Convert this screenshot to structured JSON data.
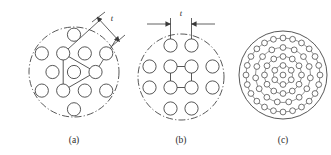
{
  "figure": {
    "background_color": "#ffffff",
    "line_color": "#3a3a3a",
    "panels": [
      {
        "id": "a",
        "caption": "(a)",
        "pattern_name": "triangular-pitch",
        "boundary_style": "chain-dash",
        "dimension_label": "t",
        "dimension_label_style": "italic",
        "dimension_type": "leader-with-arrows",
        "hole_count": 13,
        "overlay_shape": "triangle",
        "center": [
          74,
          72
        ],
        "boundary_radius": 45,
        "hole_radius": 6.6,
        "pitch": 21.5,
        "holes": [
          [
            74.0,
            72.0
          ],
          [
            52.5,
            72.0
          ],
          [
            95.5,
            72.0
          ],
          [
            63.2,
            53.4
          ],
          [
            84.8,
            53.4
          ],
          [
            63.2,
            90.6
          ],
          [
            84.8,
            90.6
          ],
          [
            41.8,
            53.4
          ],
          [
            106.2,
            53.4
          ],
          [
            41.8,
            90.6
          ],
          [
            106.2,
            90.6
          ],
          [
            74.0,
            34.7
          ],
          [
            74.0,
            109.3
          ]
        ],
        "triangle_vertices": [
          [
            63.2,
            53.4
          ],
          [
            95.5,
            72.0
          ],
          [
            63.2,
            90.6
          ]
        ],
        "leader_lines": [
          {
            "from": [
              63.2,
              53.4
            ],
            "to": [
              100.0,
              20.0
            ]
          },
          {
            "from": [
              95.5,
              72.0
            ],
            "to": [
              117.0,
              38.0
            ]
          }
        ],
        "dimension_line": {
          "from": [
            97.0,
            17.0
          ],
          "to": [
            119.5,
            41.5
          ]
        },
        "dimension_extensions": [
          {
            "from": [
              92.0,
              22.0
            ],
            "to": [
              105.0,
              12.0
            ]
          },
          {
            "from": [
              112.0,
              46.0
            ],
            "to": [
              125.0,
              35.0
            ]
          }
        ],
        "label_position": [
          112,
          21
        ]
      },
      {
        "id": "b",
        "caption": "(b)",
        "pattern_name": "square-pitch",
        "boundary_style": "chain-dash",
        "dimension_label": "t",
        "dimension_label_style": "italic",
        "dimension_type": "linear-with-extension-lines",
        "hole_count": 12,
        "overlay_shape": "square-grid",
        "center": [
          181,
          77
        ],
        "boundary_radius": 43,
        "hole_radius": 6.6,
        "pitch": 21.0,
        "holes": [
          [
            170.5,
            45.5
          ],
          [
            191.5,
            45.5
          ],
          [
            170.5,
            66.5
          ],
          [
            191.5,
            66.5
          ],
          [
            170.5,
            87.5
          ],
          [
            191.5,
            87.5
          ],
          [
            149.5,
            66.5
          ],
          [
            212.5,
            66.5
          ],
          [
            149.5,
            87.5
          ],
          [
            212.5,
            87.5
          ],
          [
            170.5,
            108.5
          ],
          [
            191.5,
            108.5
          ]
        ],
        "grid_squares": [
          [
            [
              170.5,
              66.5
            ],
            [
              191.5,
              66.5
            ],
            [
              191.5,
              87.5
            ],
            [
              170.5,
              87.5
            ]
          ]
        ],
        "extension_lines": [
          {
            "from": [
              170.5,
              45.5
            ],
            "to": [
              170.5,
              18.0
            ]
          },
          {
            "from": [
              191.5,
              45.5
            ],
            "to": [
              191.5,
              18.0
            ]
          }
        ],
        "dimension_line": {
          "y": 24.0,
          "from_x": 147.0,
          "to_x": 215.0
        },
        "arrow_inner_from_x": 170.5,
        "arrow_inner_to_x": 191.5,
        "label_position": [
          181,
          16
        ]
      },
      {
        "id": "c",
        "caption": "(c)",
        "pattern_name": "concentric-circular-pitch",
        "boundary_style": "solid",
        "dimension_label": "",
        "hole_count": 49,
        "center": [
          283,
          75
        ],
        "boundary_radius": 44,
        "hole_radius": 2.9,
        "rings": [
          {
            "radius": 0,
            "count": 1
          },
          {
            "radius": 9.5,
            "count": 6
          },
          {
            "radius": 18.5,
            "count": 12
          },
          {
            "radius": 27.5,
            "count": 15
          },
          {
            "radius": 37.0,
            "count": 24
          }
        ]
      }
    ]
  }
}
